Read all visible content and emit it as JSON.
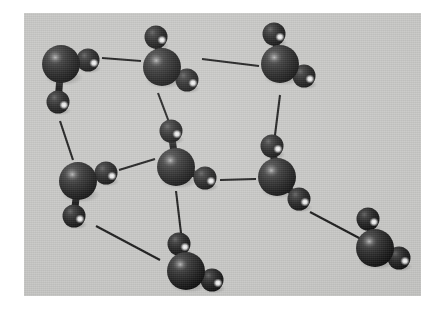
{
  "figure": {
    "panel": {
      "x": 24,
      "y": 13,
      "width": 397,
      "height": 283,
      "background_color": "#c8c8c6"
    },
    "page_background_color": "#ffffff",
    "atom_colors": {
      "oxygen_base": "#2b2b2b",
      "oxygen_shadow": "#141414",
      "oxygen_highlight": "#8d8d8d",
      "hydrogen_base": "#262626",
      "hydrogen_shadow": "#101010",
      "hydrogen_specular": "#ffffff",
      "bond_color": "#1a1a1a"
    },
    "radii": {
      "oxygen": 19,
      "hydrogen": 11.5
    }
  },
  "molecules": [
    {
      "id": "molecule-top-left",
      "label": "H2O top-left",
      "oxygen": {
        "cx": 37,
        "cy": 51
      },
      "hydrogens": [
        {
          "cx": 64,
          "cy": 47,
          "id": "h-upper-right"
        },
        {
          "cx": 34,
          "cy": 89,
          "id": "h-lower"
        }
      ]
    },
    {
      "id": "molecule-top-center",
      "label": "H2O top-center",
      "oxygen": {
        "cx": 138,
        "cy": 54
      },
      "hydrogens": [
        {
          "cx": 132,
          "cy": 24,
          "id": "h-upper"
        },
        {
          "cx": 163,
          "cy": 67,
          "id": "h-lower-right"
        }
      ]
    },
    {
      "id": "molecule-top-right",
      "label": "H2O top-right",
      "oxygen": {
        "cx": 256,
        "cy": 51
      },
      "hydrogens": [
        {
          "cx": 250,
          "cy": 21,
          "id": "h-upper"
        },
        {
          "cx": 280,
          "cy": 63,
          "id": "h-lower-right"
        }
      ]
    },
    {
      "id": "molecule-center",
      "label": "H2O center",
      "oxygen": {
        "cx": 152,
        "cy": 154
      },
      "hydrogens": [
        {
          "cx": 147,
          "cy": 118,
          "id": "h-upper"
        },
        {
          "cx": 181,
          "cy": 165,
          "id": "h-lower-right"
        }
      ]
    },
    {
      "id": "molecule-left-middle",
      "label": "H2O left-middle",
      "oxygen": {
        "cx": 54,
        "cy": 168
      },
      "hydrogens": [
        {
          "cx": 82,
          "cy": 160,
          "id": "h-upper-right"
        },
        {
          "cx": 50,
          "cy": 203,
          "id": "h-lower"
        }
      ]
    },
    {
      "id": "molecule-right-middle",
      "label": "H2O right-middle",
      "oxygen": {
        "cx": 253,
        "cy": 164
      },
      "hydrogens": [
        {
          "cx": 248,
          "cy": 133,
          "id": "h-upper"
        },
        {
          "cx": 275,
          "cy": 186,
          "id": "h-lower-right"
        }
      ]
    },
    {
      "id": "molecule-bottom-center",
      "label": "H2O bottom-center",
      "oxygen": {
        "cx": 162,
        "cy": 258
      },
      "hydrogens": [
        {
          "cx": 155,
          "cy": 231,
          "id": "h-upper"
        },
        {
          "cx": 188,
          "cy": 267,
          "id": "h-lower-right"
        }
      ]
    },
    {
      "id": "molecule-bottom-right",
      "label": "H2O bottom-right",
      "oxygen": {
        "cx": 351,
        "cy": 235
      },
      "hydrogens": [
        {
          "cx": 344,
          "cy": 206,
          "id": "h-upper"
        },
        {
          "cx": 375,
          "cy": 245,
          "id": "h-lower-right"
        }
      ]
    }
  ],
  "hydrogen_bonds": [
    {
      "id": "bond-topleft-topcenter",
      "x1": 78,
      "y1": 45,
      "x2": 117,
      "y2": 48
    },
    {
      "id": "bond-topcenter-topright",
      "x1": 178,
      "y1": 46,
      "x2": 235,
      "y2": 53
    },
    {
      "id": "bond-topleft-leftmiddle",
      "x1": 36,
      "y1": 108,
      "x2": 49,
      "y2": 147
    },
    {
      "id": "bond-topcenter-center",
      "x1": 134,
      "y1": 80,
      "x2": 151,
      "y2": 125
    },
    {
      "id": "bond-topright-rightmiddle",
      "x1": 256,
      "y1": 82,
      "x2": 250,
      "y2": 130
    },
    {
      "id": "bond-leftmiddle-center",
      "x1": 95,
      "y1": 157,
      "x2": 131,
      "y2": 146
    },
    {
      "id": "bond-center-rightmiddle",
      "x1": 196,
      "y1": 167,
      "x2": 232,
      "y2": 166
    },
    {
      "id": "bond-center-bottomcenter",
      "x1": 152,
      "y1": 178,
      "x2": 157,
      "y2": 220
    },
    {
      "id": "bond-leftmiddle-bottomcenter",
      "x1": 72,
      "y1": 213,
      "x2": 136,
      "y2": 247
    },
    {
      "id": "bond-rightmiddle-bottomright",
      "x1": 286,
      "y1": 199,
      "x2": 337,
      "y2": 226
    }
  ]
}
